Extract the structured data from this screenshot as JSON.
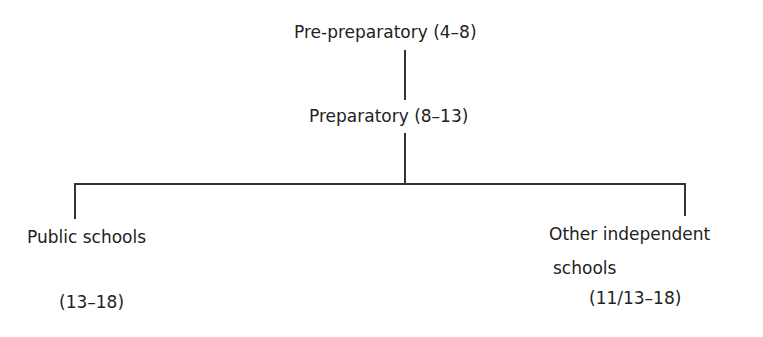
{
  "diagram": {
    "nodes": {
      "pre_preparatory": "Pre-preparatory (4–8)",
      "preparatory": "Preparatory (8–13)",
      "public_label": "Public schools",
      "public_ages": "(13–18)",
      "other_line1": "Other independent",
      "other_line2": "schools",
      "other_ages": "(11/13–18)"
    }
  }
}
